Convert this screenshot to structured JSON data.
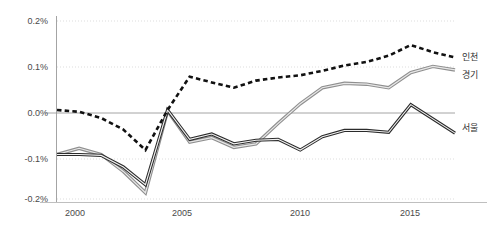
{
  "chart_data": {
    "type": "line",
    "title": "",
    "xlabel": "",
    "ylabel": "",
    "xlim": [
      1999,
      2017
    ],
    "ylim": [
      -0.2,
      0.2
    ],
    "grid": true,
    "legend_position": "right-inline",
    "x": [
      1999,
      2000,
      2001,
      2002,
      2003,
      2004,
      2005,
      2006,
      2007,
      2008,
      2009,
      2010,
      2011,
      2012,
      2013,
      2014,
      2015,
      2016,
      2017
    ],
    "xticks": [
      "2000",
      "2005",
      "2010",
      "2015"
    ],
    "xtick_values": [
      2000,
      2005,
      2010,
      2015
    ],
    "yticks": [
      "0.2%",
      "0.1%",
      "0.0%",
      "-0.1%",
      "-0.2%"
    ],
    "ytick_values": [
      0.2,
      0.1,
      0.0,
      -0.1,
      -0.2
    ],
    "series": [
      {
        "name": "인천",
        "style": "dotted",
        "color": "#111111",
        "values": [
          0.0,
          -0.004,
          -0.018,
          -0.044,
          -0.09,
          0.0,
          0.075,
          0.062,
          0.05,
          0.066,
          0.073,
          0.078,
          0.088,
          0.1,
          0.108,
          0.122,
          0.146,
          0.13,
          0.118
        ]
      },
      {
        "name": "경기",
        "style": "solid-light",
        "color": "#8f8f8f",
        "values": [
          -0.1,
          -0.086,
          -0.1,
          -0.138,
          -0.186,
          -0.002,
          -0.072,
          -0.062,
          -0.084,
          -0.076,
          -0.03,
          0.014,
          0.05,
          0.06,
          0.058,
          0.05,
          0.084,
          0.098,
          0.09
        ]
      },
      {
        "name": "서울",
        "style": "solid-dark",
        "color": "#2b2b2b",
        "values": [
          -0.1,
          -0.1,
          -0.102,
          -0.128,
          -0.168,
          0.0,
          -0.066,
          -0.054,
          -0.076,
          -0.068,
          -0.066,
          -0.09,
          -0.06,
          -0.046,
          -0.046,
          -0.05,
          0.012,
          -0.02,
          -0.052
        ]
      }
    ]
  },
  "axis": {
    "y_labels": [
      "0.2%",
      "0.1%",
      "0.0%",
      "-0.1%",
      "-0.2%"
    ],
    "x_labels": [
      "2000",
      "2005",
      "2010",
      "2015"
    ]
  },
  "legend": {
    "incheon": "인천",
    "gyeonggi": "경기",
    "seoul": "서울"
  }
}
